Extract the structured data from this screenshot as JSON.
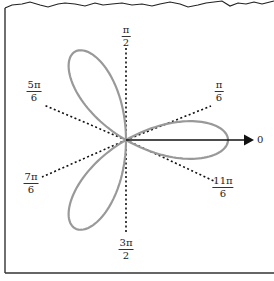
{
  "figure": {
    "type": "polar rose curve",
    "equation_implied": "r = a cos(3θ)",
    "petals": 3,
    "petal_directions": [
      "0",
      "2π/3",
      "4π/3"
    ],
    "colors": {
      "curve": "#999999",
      "axes": "#111111",
      "frame": "#222222"
    }
  },
  "labels": {
    "zero": "0",
    "pi_over_6": {
      "num": "π",
      "den": "6"
    },
    "pi_over_2": {
      "num": "π",
      "den": "2"
    },
    "five_pi_over_6": {
      "num": "5π",
      "den": "6"
    },
    "seven_pi_over_6": {
      "num": "7π",
      "den": "6"
    },
    "three_pi_over_2": {
      "num": "3π",
      "den": "2"
    },
    "eleven_pi_over_6": {
      "num": "11π",
      "den": "6"
    }
  }
}
